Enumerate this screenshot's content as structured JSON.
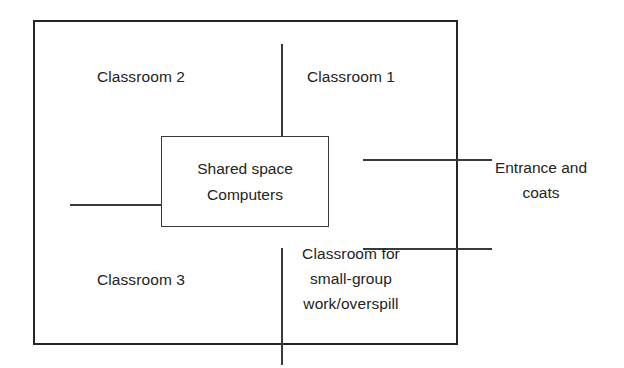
{
  "diagram": {
    "type": "floor-plan",
    "background_color": "#ffffff",
    "line_color": "#262626",
    "inner_line_color": "#3a3a3a",
    "text_color": "#232323"
  },
  "rooms": {
    "classroom_2": {
      "label": "Classroom 2"
    },
    "classroom_1": {
      "label": "Classroom 1"
    },
    "classroom_3": {
      "label": "Classroom 3"
    },
    "small_group": {
      "label": "Classroom for\nsmall-group\nwork/overspill"
    },
    "shared_space": {
      "line1": "Shared space",
      "line2": "Computers"
    },
    "corridor": {
      "label": ""
    }
  },
  "exterior": {
    "entrance": {
      "label": "Entrance and\ncoats"
    }
  }
}
